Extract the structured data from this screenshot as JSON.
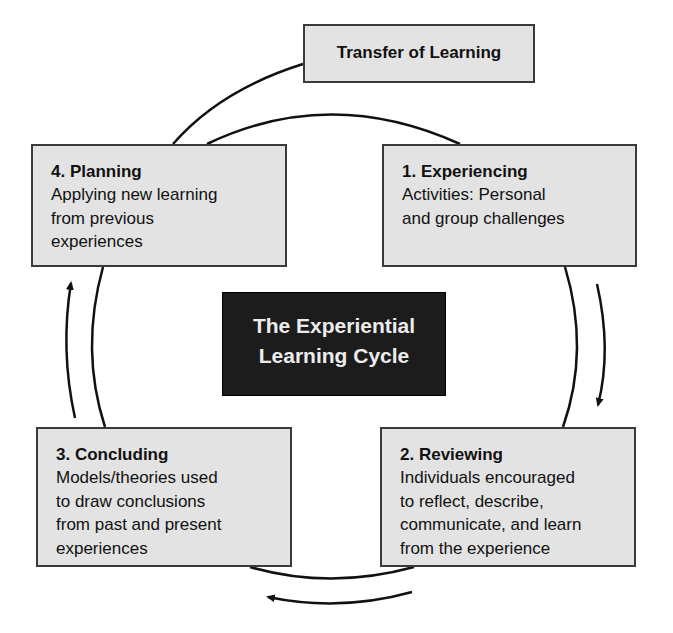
{
  "diagram": {
    "title": "The Experiential Learning Cycle",
    "title_lines": [
      "The Experiential",
      "Learning Cycle"
    ],
    "transfer": {
      "label": "Transfer of Learning"
    },
    "stages": [
      {
        "id": "planning",
        "title": "4. Planning",
        "description": "Applying new learning from previous experiences",
        "lines": [
          "Applying new learning",
          "from previous",
          "experiences"
        ]
      },
      {
        "id": "experiencing",
        "title": "1. Experiencing",
        "description": "Activities: Personal and group challenges",
        "lines": [
          "Activities: Personal",
          "and group challenges"
        ]
      },
      {
        "id": "concluding",
        "title": "3. Concluding",
        "description": "Models/theories used to draw conclusions from past and present experiences",
        "lines": [
          "Models/theories used",
          "to draw conclusions",
          "from past and present",
          "experiences"
        ]
      },
      {
        "id": "reviewing",
        "title": "2. Reviewing",
        "description": "Individuals encouraged to reflect, describe, communicate, and learn from the experience",
        "lines": [
          "Individuals encouraged",
          "to reflect, describe,",
          "communicate, and learn",
          "from the experience"
        ]
      }
    ],
    "flow": [
      {
        "from": "1. Experiencing",
        "to": "2. Reviewing",
        "direction": "clockwise"
      },
      {
        "from": "2. Reviewing",
        "to": "3. Concluding",
        "direction": "clockwise"
      },
      {
        "from": "3. Concluding",
        "to": "4. Planning",
        "direction": "clockwise"
      },
      {
        "from": "4. Planning",
        "to": "1. Experiencing",
        "direction": "clockwise"
      },
      {
        "from": "4. Planning",
        "to": "Transfer of Learning",
        "direction": "branch"
      }
    ],
    "colors": {
      "box_fill": "#e3e3e3",
      "box_border": "#3a3a3a",
      "center_fill": "#1c1c1c",
      "center_text": "#ececec",
      "line": "#111111"
    }
  }
}
